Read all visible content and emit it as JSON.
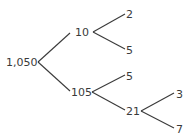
{
  "diagram": {
    "type": "factor-tree",
    "nodes": [
      {
        "id": "n1050",
        "label": "1,050",
        "x": 6,
        "y": 66
      },
      {
        "id": "n10",
        "label": "10",
        "x": 75,
        "y": 36
      },
      {
        "id": "n105",
        "label": "105",
        "x": 71,
        "y": 96
      },
      {
        "id": "n2",
        "label": "2",
        "x": 126,
        "y": 18
      },
      {
        "id": "n5a",
        "label": "5",
        "x": 126,
        "y": 54
      },
      {
        "id": "n5b",
        "label": "5",
        "x": 126,
        "y": 80
      },
      {
        "id": "n21",
        "label": "21",
        "x": 126,
        "y": 115
      },
      {
        "id": "n3",
        "label": "3",
        "x": 176,
        "y": 98
      },
      {
        "id": "n7",
        "label": "7",
        "x": 176,
        "y": 133
      }
    ],
    "edges": [
      {
        "from": "n1050",
        "to": "n10",
        "x1": 38,
        "y1": 62,
        "x2": 70,
        "y2": 33
      },
      {
        "from": "n1050",
        "to": "n105",
        "x1": 38,
        "y1": 62,
        "x2": 70,
        "y2": 91
      },
      {
        "from": "n10",
        "to": "n2",
        "x1": 93,
        "y1": 32,
        "x2": 125,
        "y2": 14
      },
      {
        "from": "n10",
        "to": "n5a",
        "x1": 93,
        "y1": 32,
        "x2": 125,
        "y2": 49
      },
      {
        "from": "n105",
        "to": "n5b",
        "x1": 92,
        "y1": 92,
        "x2": 125,
        "y2": 75
      },
      {
        "from": "n105",
        "to": "n21",
        "x1": 92,
        "y1": 92,
        "x2": 125,
        "y2": 110
      },
      {
        "from": "n21",
        "to": "n3",
        "x1": 141,
        "y1": 111,
        "x2": 174,
        "y2": 93
      },
      {
        "from": "n21",
        "to": "n7",
        "x1": 141,
        "y1": 111,
        "x2": 174,
        "y2": 128
      }
    ]
  }
}
